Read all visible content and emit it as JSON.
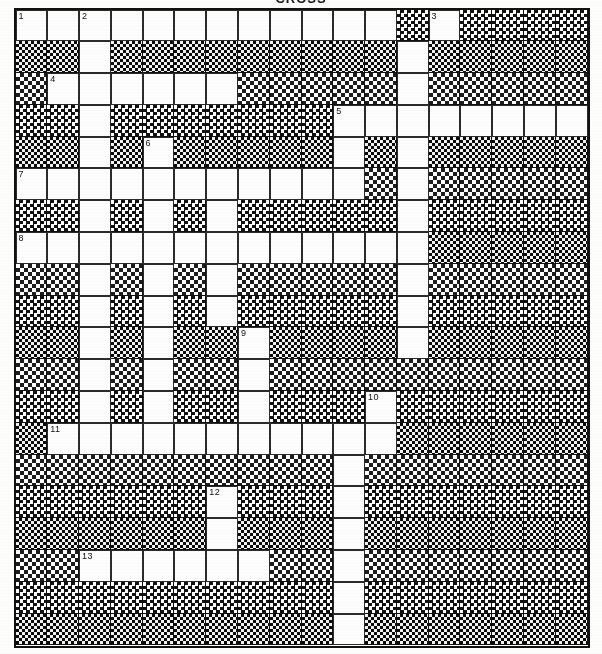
{
  "title": "CROSS",
  "puzzle": {
    "name": "crossword-grid",
    "columns": 18,
    "rows": 20,
    "colors": {
      "ink": "#111111",
      "paper": "#fdfdfc",
      "cell_fill": "#fdfdfd",
      "rule": "#2b2b2b"
    },
    "legend": {
      "white": "open answer cell",
      "block": "blocked halftone cell"
    },
    "clue_numbers": [
      1,
      2,
      3,
      4,
      5,
      6,
      7,
      8,
      9,
      10,
      11,
      12,
      13
    ],
    "numbered_cells": [
      {
        "number": 1,
        "row": 0,
        "col": 0
      },
      {
        "number": 2,
        "row": 0,
        "col": 2
      },
      {
        "number": 3,
        "row": 0,
        "col": 13
      },
      {
        "number": 4,
        "row": 2,
        "col": 1
      },
      {
        "number": 5,
        "row": 3,
        "col": 10
      },
      {
        "number": 6,
        "row": 4,
        "col": 4
      },
      {
        "number": 7,
        "row": 5,
        "col": 0
      },
      {
        "number": 8,
        "row": 7,
        "col": 0
      },
      {
        "number": 9,
        "row": 10,
        "col": 7
      },
      {
        "number": 10,
        "row": 12,
        "col": 11
      },
      {
        "number": 11,
        "row": 13,
        "col": 1
      },
      {
        "number": 12,
        "row": 15,
        "col": 6
      },
      {
        "number": 13,
        "row": 17,
        "col": 2
      }
    ],
    "grid": [
      "WWWWWWWWWWWW.W....",
      "..W.........W.....",
      ".WWWWWW.....W.....",
      "..W.......WWWWWWWW",
      "..W.W.....W.W.....",
      "WWWWWWWWWWW.W.....",
      "..W.W.W.....W.....",
      "WWWWWWWWWWWWW.....",
      "..W.W.W.....W.....",
      "..W.W.W.....W.....",
      "..W.W..W....W.....",
      "..W.W..W..........",
      "..W.W..W...W......",
      ".WWWWWWWWWWW......",
      "..........W.......",
      "......W...W.......",
      "......W...W.......",
      "..WWWWWW..W.......",
      "..........W.......",
      "..........W......."
    ]
  }
}
